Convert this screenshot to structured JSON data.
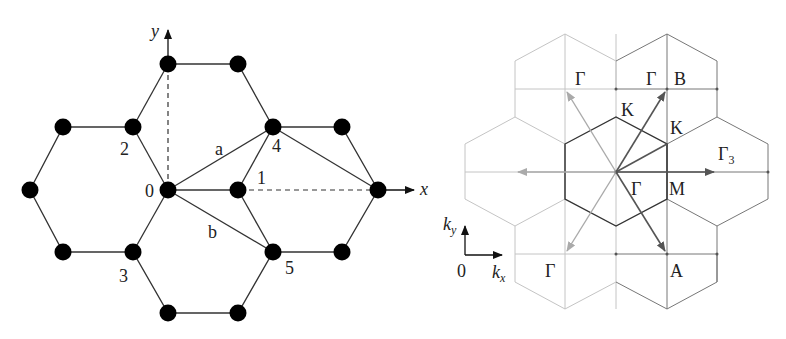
{
  "left_panel": {
    "title": "Honeycomb lattice (real space)",
    "axis_x_label": "x",
    "axis_y_label": "y",
    "site_labels": [
      {
        "text": "0",
        "x": 153,
        "y": 197
      },
      {
        "text": "1",
        "x": 256,
        "y": 184
      },
      {
        "text": "2",
        "x": 120,
        "y": 155
      },
      {
        "text": "3",
        "x": 118,
        "y": 282
      },
      {
        "text": "4",
        "x": 272,
        "y": 152
      },
      {
        "text": "5",
        "x": 286,
        "y": 274
      }
    ],
    "bond_labels": [
      {
        "text": "a",
        "x": 215,
        "y": 155
      },
      {
        "text": "b",
        "x": 208,
        "y": 238
      }
    ],
    "nodes": [
      [
        168,
        64
      ],
      [
        238,
        64
      ],
      [
        63,
        127
      ],
      [
        133,
        127
      ],
      [
        273,
        127
      ],
      [
        342,
        127
      ],
      [
        30,
        190
      ],
      [
        168,
        190
      ],
      [
        238,
        190
      ],
      [
        378,
        190
      ],
      [
        63,
        252
      ],
      [
        133,
        252
      ],
      [
        273,
        252
      ],
      [
        342,
        252
      ],
      [
        168,
        313
      ],
      [
        238,
        313
      ]
    ]
  },
  "right_panel": {
    "title": "Reciprocal lattice / Brillouin zones",
    "axis_kx_label": "k",
    "axis_kx_sub": "x",
    "axis_ky_label": "k",
    "axis_ky_sub": "y",
    "origin_label": "0",
    "point_labels": [
      {
        "text": "Γ",
        "x": 575,
        "y": 85
      },
      {
        "text": "Γ",
        "x": 646,
        "y": 85
      },
      {
        "text": "B",
        "x": 675,
        "y": 85
      },
      {
        "text": "K",
        "x": 622,
        "y": 116
      },
      {
        "text": "K",
        "x": 671,
        "y": 133
      },
      {
        "text": "Γ",
        "x": 719,
        "y": 160
      },
      {
        "text": "Γ",
        "x": 631,
        "y": 195
      },
      {
        "text": "M",
        "x": 671,
        "y": 195
      },
      {
        "text": "A",
        "x": 671,
        "y": 276
      },
      {
        "text": "Γ",
        "x": 545,
        "y": 276
      }
    ],
    "gamma3_sub": "3"
  },
  "colors": {
    "dark": "#333333",
    "mid": "#666666",
    "light": "#bbbbbb",
    "node": "#000000"
  }
}
